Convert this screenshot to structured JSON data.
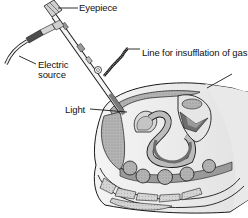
{
  "diagram": {
    "labels": {
      "eyepiece": "Eyepiece",
      "electric_source_line1": "Electric",
      "electric_source_line2": "source",
      "insufflation": "Line for insufflation of gas",
      "light": "Light"
    },
    "colors": {
      "background": "#ffffff",
      "line": "#1a1a1a",
      "dark_fill": "#6e6e6e",
      "mid_fill": "#9a9a9a",
      "light_fill": "#c8c8c8",
      "pale_fill": "#e4e4e4"
    }
  }
}
